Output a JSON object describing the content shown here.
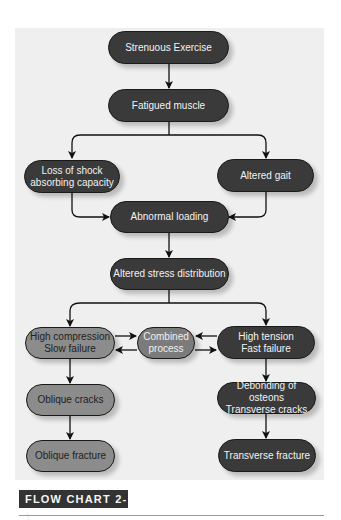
{
  "figure": {
    "caption": "FLOW CHART 2-1",
    "colors": {
      "panel": "#efefef",
      "dark_node": "#3a3a3a",
      "gray_node": "#8c8c8c",
      "combined_node": "#7b7b7b",
      "caption_bg": "#333333"
    }
  },
  "nodes": {
    "strenuous_exercise": "Strenuous Exercise",
    "fatigued_muscle": "Fatigued muscle",
    "loss_of_shock": "Loss of shock\nabsorbing capacity",
    "altered_gait": "Altered gait",
    "abnormal_loading": "Abnormal loading",
    "altered_stress": "Altered stress distribution",
    "high_compression": "High compression\nSlow failure",
    "combined_process": "Combined\nprocess",
    "high_tension": "High tension\nFast failure",
    "oblique_cracks": "Oblique cracks",
    "debonding": "Debonding of osteons\nTransverse cracks",
    "oblique_fracture": "Oblique fracture",
    "transverse_fracture": "Transverse fracture"
  },
  "edges": [
    [
      "strenuous_exercise",
      "fatigued_muscle"
    ],
    [
      "fatigued_muscle",
      "loss_of_shock"
    ],
    [
      "fatigued_muscle",
      "altered_gait"
    ],
    [
      "loss_of_shock",
      "abnormal_loading"
    ],
    [
      "altered_gait",
      "abnormal_loading"
    ],
    [
      "abnormal_loading",
      "altered_stress"
    ],
    [
      "altered_stress",
      "high_compression"
    ],
    [
      "altered_stress",
      "high_tension"
    ],
    [
      "high_compression",
      "combined_process"
    ],
    [
      "combined_process",
      "high_compression"
    ],
    [
      "high_tension",
      "combined_process"
    ],
    [
      "combined_process",
      "high_tension"
    ],
    [
      "high_compression",
      "oblique_cracks"
    ],
    [
      "oblique_cracks",
      "oblique_fracture"
    ],
    [
      "high_tension",
      "debonding"
    ],
    [
      "debonding",
      "transverse_fracture"
    ]
  ]
}
